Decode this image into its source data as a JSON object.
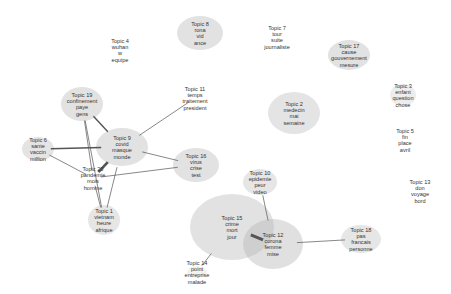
{
  "diagram": {
    "type": "topic-network",
    "nodes": [
      {
        "id": 1,
        "title": "Topic 1",
        "words": [
          "vietnam",
          "heure",
          "afrique"
        ],
        "x": 104,
        "y": 220,
        "rx": 16,
        "ry": 15,
        "fill": "#e6e6e6"
      },
      {
        "id": 2,
        "title": "Topic 2",
        "words": [
          "medecin",
          "mai",
          "semaine"
        ],
        "x": 294,
        "y": 113,
        "rx": 26,
        "ry": 21,
        "fill": "#e4e4e4"
      },
      {
        "id": 3,
        "title": "Topic 3",
        "words": [
          "enfant",
          "question",
          "chose"
        ],
        "x": 403,
        "y": 95,
        "rx": 13,
        "ry": 11,
        "fill": "#ededed"
      },
      {
        "id": 4,
        "title": "Topic 4",
        "words": [
          "wuhan",
          "w",
          "equipe"
        ],
        "x": 120,
        "y": 50,
        "rx": 0,
        "ry": 0,
        "fill": "none"
      },
      {
        "id": 5,
        "title": "Topic 5",
        "words": [
          "fin",
          "place",
          "avril"
        ],
        "x": 405,
        "y": 140,
        "rx": 0,
        "ry": 0,
        "fill": "none"
      },
      {
        "id": 6,
        "title": "Topic 6",
        "words": [
          "sante",
          "vaccin",
          "million"
        ],
        "x": 38,
        "y": 149,
        "rx": 16,
        "ry": 12,
        "fill": "#e4e4e4"
      },
      {
        "id": 7,
        "title": "Topic 7",
        "words": [
          "tour",
          "suite",
          "journaliste"
        ],
        "x": 277,
        "y": 37,
        "rx": 0,
        "ry": 0,
        "fill": "none"
      },
      {
        "id": 8,
        "title": "Topic 8",
        "words": [
          "rona",
          "vid",
          "ance"
        ],
        "x": 200,
        "y": 33,
        "rx": 23,
        "ry": 17,
        "fill": "#e2e2e2"
      },
      {
        "id": 9,
        "title": "Topic 9",
        "words": [
          "covid",
          "masque",
          "monde"
        ],
        "x": 122,
        "y": 147,
        "rx": 26,
        "ry": 19,
        "fill": "#e2e2e2"
      },
      {
        "id": 10,
        "title": "Topic 10",
        "words": [
          "epidemie",
          "peur",
          "video"
        ],
        "x": 260,
        "y": 182,
        "rx": 17,
        "ry": 13,
        "fill": "#e6e6e6"
      },
      {
        "id": 11,
        "title": "Topic 11",
        "words": [
          "temps",
          "traitement",
          "president"
        ],
        "x": 195,
        "y": 98,
        "rx": 0,
        "ry": 0,
        "fill": "none"
      },
      {
        "id": 12,
        "title": "Topic 12",
        "words": [
          "corona",
          "femme",
          "mise"
        ],
        "x": 273,
        "y": 244,
        "rx": 30,
        "ry": 25,
        "fill": "#e0e0e0"
      },
      {
        "id": 13,
        "title": "Topic 13",
        "words": [
          "don",
          "voyage",
          "bord"
        ],
        "x": 420,
        "y": 191,
        "rx": 0,
        "ry": 0,
        "fill": "none"
      },
      {
        "id": 14,
        "title": "Topic 14",
        "words": [
          "point",
          "entreprise",
          "malade"
        ],
        "x": 197,
        "y": 272,
        "rx": 10,
        "ry": 6,
        "fill": "#f2f2f2"
      },
      {
        "id": 15,
        "title": "Topic 15",
        "words": [
          "crime",
          "mort",
          "jour"
        ],
        "x": 232,
        "y": 227,
        "rx": 42,
        "ry": 33,
        "fill": "#e2e2e2"
      },
      {
        "id": 16,
        "title": "Topic 16",
        "words": [
          "virus",
          "crise",
          "test"
        ],
        "x": 196,
        "y": 165,
        "rx": 23,
        "ry": 17,
        "fill": "#e2e2e2"
      },
      {
        "id": 17,
        "title": "Topic 17",
        "words": [
          "cause",
          "gouvernement",
          "mesure"
        ],
        "x": 349,
        "y": 55,
        "rx": 21,
        "ry": 15,
        "fill": "#e2e2e2"
      },
      {
        "id": 18,
        "title": "Topic 18",
        "words": [
          "pas",
          "francais",
          "personne"
        ],
        "x": 361,
        "y": 239,
        "rx": 20,
        "ry": 14,
        "fill": "#e6e6e6"
      },
      {
        "id": 19,
        "title": "Topic 19",
        "words": [
          "confinement",
          "paye",
          "gens"
        ],
        "x": 82,
        "y": 104,
        "rx": 21,
        "ry": 17,
        "fill": "#e2e2e2"
      },
      {
        "id": 20,
        "title": "Topic 20",
        "words": [
          "pandemie",
          "mois",
          "homme"
        ],
        "x": 93,
        "y": 178,
        "rx": 0,
        "ry": 0,
        "fill": "none"
      }
    ],
    "edges": [
      {
        "from": 9,
        "to": 19,
        "weight": 1.4
      },
      {
        "from": 9,
        "to": 11,
        "weight": 0.7
      },
      {
        "from": 9,
        "to": 6,
        "weight": 1.4
      },
      {
        "from": 9,
        "to": 20,
        "weight": 2.6
      },
      {
        "from": 9,
        "to": 16,
        "weight": 0.7
      },
      {
        "from": 9,
        "to": 1,
        "weight": 0.7
      },
      {
        "from": 19,
        "to": 1,
        "weight": 0.7
      },
      {
        "from": 19,
        "to": 20,
        "weight": 0.7
      },
      {
        "from": 6,
        "to": 20,
        "weight": 0.7
      },
      {
        "from": 20,
        "to": 16,
        "weight": 0.7
      },
      {
        "from": 20,
        "to": 1,
        "weight": 0.7
      },
      {
        "from": 15,
        "to": 12,
        "weight": 3.0
      },
      {
        "from": 12,
        "to": 10,
        "weight": 0.7
      },
      {
        "from": 12,
        "to": 18,
        "weight": 0.7
      },
      {
        "from": 15,
        "to": 14,
        "weight": 0.7
      }
    ],
    "overlap_fill": "#cfcfcf",
    "edge_color": "#555555"
  }
}
